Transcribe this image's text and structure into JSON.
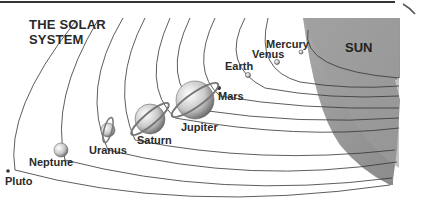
{
  "title_line1": "THE SOLAR",
  "title_line2": "SYSTEM",
  "sun": {
    "label": "SUN",
    "color": "#9a9a9a"
  },
  "planets": [
    {
      "name": "Mercury",
      "order": 1
    },
    {
      "name": "Venus",
      "order": 2
    },
    {
      "name": "Earth",
      "order": 3
    },
    {
      "name": "Mars",
      "order": 4
    },
    {
      "name": "Jupiter",
      "order": 5
    },
    {
      "name": "Saturn",
      "order": 6
    },
    {
      "name": "Uranus",
      "order": 7
    },
    {
      "name": "Neptune",
      "order": 8
    },
    {
      "name": "Pluto",
      "order": 9
    }
  ]
}
